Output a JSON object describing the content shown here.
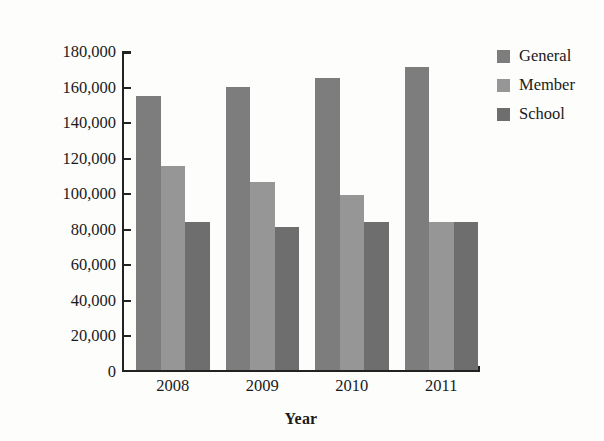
{
  "chart_data": {
    "type": "bar",
    "title": "",
    "xlabel": "Year",
    "ylabel": "Attendance",
    "categories": [
      "2008",
      "2009",
      "2010",
      "2011"
    ],
    "series": [
      {
        "name": "General",
        "color": "#7d7d7d",
        "values": [
          154000,
          159000,
          164500,
          170500
        ]
      },
      {
        "name": "Member",
        "color": "#969696",
        "values": [
          115000,
          105500,
          98500,
          83000
        ]
      },
      {
        "name": "School",
        "color": "#6e6e6e",
        "values": [
          83000,
          80500,
          83000,
          83000
        ]
      }
    ],
    "ylim": [
      0,
      180000
    ],
    "ytick_values": [
      0,
      20000,
      40000,
      60000,
      80000,
      100000,
      120000,
      140000,
      160000,
      180000
    ],
    "ytick_labels": [
      "0",
      "20,000",
      "40,000",
      "60,000",
      "80,000",
      "100,000",
      "120,000",
      "140,000",
      "160,000",
      "180,000"
    ],
    "grid": false,
    "legend_position": "top-right",
    "legend_entries": [
      "General",
      "Member",
      "School"
    ]
  },
  "axis_color": "#222222",
  "background_color": "#fdfdfc"
}
